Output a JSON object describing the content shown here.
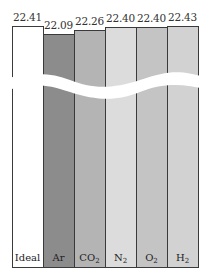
{
  "chart_data": {
    "type": "bar",
    "title": "",
    "xlabel": "",
    "ylabel": "",
    "axis_break": true,
    "categories": [
      "Ideal",
      "Ar",
      "CO2",
      "N2",
      "O2",
      "H2"
    ],
    "category_labels": [
      {
        "base": "Ideal",
        "sub": ""
      },
      {
        "base": "Ar",
        "sub": ""
      },
      {
        "base": "CO",
        "sub": "2"
      },
      {
        "base": "N",
        "sub": "2"
      },
      {
        "base": "O",
        "sub": "2"
      },
      {
        "base": "H",
        "sub": "2"
      }
    ],
    "values": [
      22.41,
      22.09,
      22.26,
      22.4,
      22.4,
      22.43
    ],
    "value_labels": [
      "22.41",
      "22.09",
      "22.26",
      "22.40",
      "22.40",
      "22.43"
    ],
    "colors": [
      "#ffffff",
      "#8c8c8c",
      "#b4b4b4",
      "#dcdcdc",
      "#c4c4c4",
      "#d2d2d2"
    ],
    "grid": false,
    "legend": "none"
  }
}
